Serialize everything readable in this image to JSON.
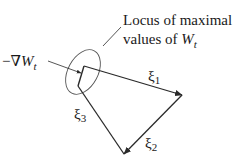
{
  "diagram": {
    "type": "vector-polygon",
    "colors": {
      "stroke": "#2a2a2a",
      "text": "#1a1a1a",
      "background": "#ffffff"
    },
    "annotation": {
      "line1": "Locus of maximal",
      "line2_prefix": "values of ",
      "line2_var": "W",
      "line2_sub": "t"
    },
    "gradient_label": {
      "prefix": "−∇",
      "var": "W",
      "sub": "t"
    },
    "vectors": [
      {
        "name": "xi1",
        "symbol": "ξ",
        "sub": "1",
        "from": [
          84,
          66
        ],
        "to": [
          182,
          95
        ]
      },
      {
        "name": "xi2",
        "symbol": "ξ",
        "sub": "2",
        "from": [
          182,
          95
        ],
        "to": [
          124,
          154
        ]
      },
      {
        "name": "xi3",
        "symbol": "ξ",
        "sub": "3",
        "from": [
          124,
          154
        ],
        "to": [
          78,
          86
        ]
      }
    ],
    "ellipse": {
      "cx": 83,
      "cy": 72,
      "rx": 15,
      "ry": 24,
      "rotation_deg": 28
    }
  }
}
